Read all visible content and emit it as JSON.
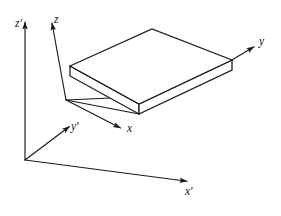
{
  "figure": {
    "background_color": "#ffffff",
    "line_color": "#1a1a1a",
    "slab_fill_color": "#ffffff",
    "width": 281,
    "height": 216
  },
  "frames": [
    {
      "name": "primed-frame",
      "origin": [
        25,
        160
      ],
      "axes": [
        {
          "key": "z_prime",
          "label": "z′",
          "tip": [
            25,
            18
          ]
        },
        {
          "key": "y_prime",
          "label": "y′",
          "tip": [
            72,
            124
          ]
        },
        {
          "key": "x_prime",
          "label": "x′",
          "tip": [
            191,
            182
          ]
        }
      ]
    },
    {
      "name": "unprimed-frame",
      "origin": [
        66,
        100
      ],
      "axes": [
        {
          "key": "z",
          "label": "z",
          "tip": [
            51,
            18
          ]
        },
        {
          "key": "x",
          "label": "x",
          "tip": [
            124,
            131
          ]
        },
        {
          "key": "y",
          "label": "y",
          "tip": [
            258,
            45
          ]
        }
      ]
    }
  ],
  "labels": {
    "z_prime": "z′",
    "y_prime": "y′",
    "x_prime": "x′",
    "z": "z",
    "y": "y",
    "x": "x"
  },
  "slab": {
    "name": "rectangular-slab",
    "description": "thin rectangular plate shown in oblique projection",
    "top_face": [
      [
        70,
        66
      ],
      [
        152,
        29
      ],
      [
        232,
        60
      ],
      [
        139,
        104
      ]
    ],
    "front_face": [
      [
        70,
        66
      ],
      [
        139,
        104
      ],
      [
        139,
        114
      ],
      [
        70,
        76
      ]
    ],
    "right_face": [
      [
        139,
        104
      ],
      [
        232,
        60
      ],
      [
        232,
        70
      ],
      [
        139,
        114
      ]
    ],
    "connector_lines": [
      {
        "from": [
          66,
          100
        ],
        "to": [
          120,
          98
        ]
      },
      {
        "from": [
          66,
          100
        ],
        "to": [
          139,
          114
        ]
      }
    ]
  }
}
